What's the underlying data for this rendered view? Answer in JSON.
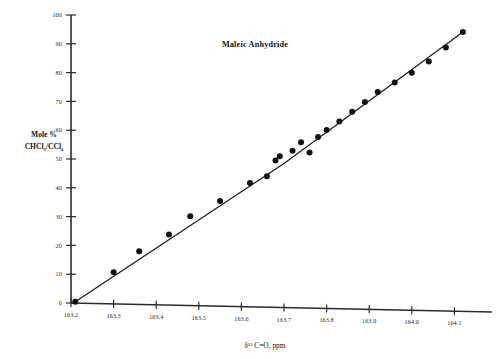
{
  "chart_data": {
    "type": "scatter",
    "title": "Maleic Anhydride",
    "xlabel": "δ¹³ C=O, ppm",
    "ylabel_line1": "Mole %",
    "ylabel_line2": "CHCl₃/CCl₄",
    "xlim": [
      163.15,
      164.2
    ],
    "ylim": [
      0,
      100
    ],
    "grid": false,
    "legend": null,
    "xticks": [
      163.2,
      163.3,
      163.4,
      163.5,
      163.6,
      163.7,
      163.8,
      163.9,
      164.0,
      164.1
    ],
    "xtick_labels": [
      "163.2",
      "163.3",
      "163.4",
      "163.5",
      "163.6",
      "163.7",
      "163.8",
      "163.9",
      "164.0",
      "164.1"
    ],
    "yticks": [
      0,
      10,
      20,
      30,
      40,
      50,
      60,
      70,
      80,
      90,
      100
    ],
    "ytick_labels": [
      "0",
      "10",
      "20",
      "30",
      "40",
      "50",
      "60",
      "70",
      "80",
      "90",
      "100"
    ],
    "series": [
      {
        "name": "Maleic anhydride data",
        "marker": "filled-circle",
        "x": [
          163.21,
          163.3,
          163.36,
          163.43,
          163.48,
          163.55,
          163.62,
          163.66,
          163.68,
          163.69,
          163.72,
          163.74,
          163.76,
          163.78,
          163.8,
          163.83,
          163.86,
          163.89,
          163.92,
          163.96,
          164.0,
          164.04,
          164.08,
          164.12
        ],
        "y": [
          0.5,
          11.0,
          18.5,
          24.5,
          31.0,
          36.5,
          43.0,
          45.5,
          51.0,
          52.5,
          54.5,
          57.5,
          54.0,
          59.5,
          62.0,
          65.0,
          68.5,
          72.0,
          75.5,
          79.0,
          82.5,
          86.5,
          91.5,
          97.0
        ]
      }
    ],
    "fit_line": {
      "name": "trend",
      "x": [
        163.21,
        163.7,
        164.12
      ],
      "y": [
        0.5,
        50.0,
        97.0
      ]
    }
  }
}
